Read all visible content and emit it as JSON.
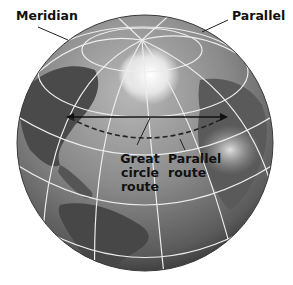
{
  "diagram": {
    "type": "globe-illustration",
    "colors": {
      "background": "#ffffff",
      "ocean_light": "#9a9a9a",
      "ocean_dark": "#3a3a3a",
      "land": "#5a5a5a",
      "ice": "#f2f2f2",
      "grid_lines": "#e8e8e8",
      "route_line": "#111111",
      "label_text": "#111111"
    },
    "labels": {
      "meridian": "Meridian",
      "parallel": "Parallel",
      "great_circle_line1": "Great",
      "great_circle_line2": "circle",
      "great_circle_line3": "route",
      "parallel_route_line1": "Parallel",
      "parallel_route_line2": "route"
    },
    "routes": [
      {
        "name": "great-circle-route",
        "style": "dashed",
        "shape": "arc"
      },
      {
        "name": "parallel-route",
        "style": "solid",
        "shape": "straight",
        "arrowheads": "both"
      }
    ]
  }
}
